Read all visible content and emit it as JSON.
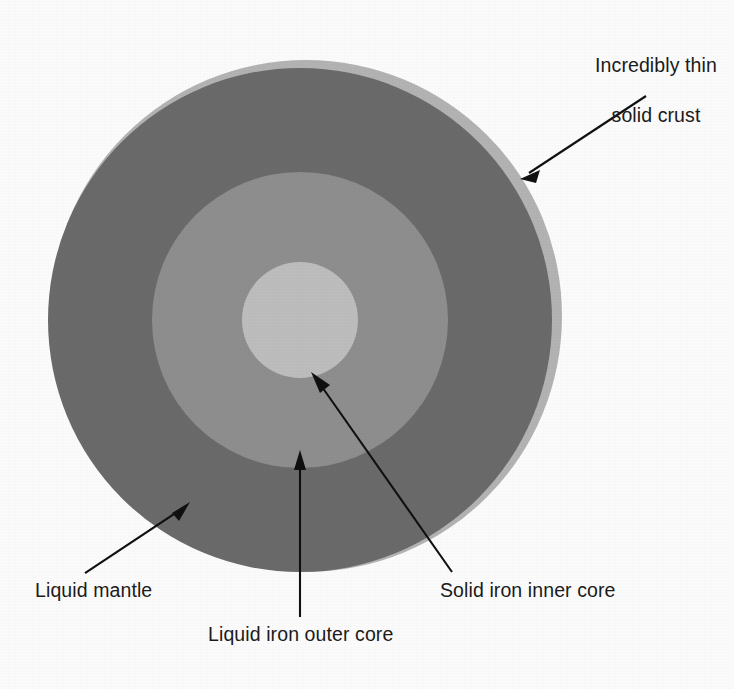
{
  "diagram": {
    "background_color": "#fdfdfd",
    "center": {
      "x": 300,
      "y": 320
    },
    "layers": [
      {
        "key": "crust",
        "label": "Incredibly thin\nsolid crust",
        "color": "#b3b3b3",
        "radius": 256,
        "offset_x": 6,
        "offset_y": -4,
        "description": "Incredibly thin solid crust"
      },
      {
        "key": "mantle",
        "label": "Liquid mantle",
        "color": "#6b6b6b",
        "radius": 252,
        "offset_x": 0,
        "offset_y": 0,
        "description": "Liquid mantle"
      },
      {
        "key": "outer_core",
        "label": "Liquid iron outer core",
        "color": "#8e8e8e",
        "radius": 148,
        "offset_x": 0,
        "offset_y": 0,
        "description": "Liquid iron outer core"
      },
      {
        "key": "inner_core",
        "label": "Solid iron inner core",
        "color": "#bdbdbd",
        "radius": 58,
        "offset_x": 0,
        "offset_y": 0,
        "description": "Solid iron inner core"
      }
    ],
    "labels": {
      "crust": {
        "line1": "Incredibly thin",
        "line2": "solid crust"
      },
      "mantle": "Liquid mantle",
      "outer_core": "Liquid iron outer core",
      "inner_core": "Solid iron inner core"
    },
    "leader_lines": [
      {
        "name": "crust-leader",
        "from_x": 646,
        "from_y": 96,
        "to_x": 523,
        "to_y": 177
      },
      {
        "name": "mantle-leader",
        "from_x": 85,
        "from_y": 573,
        "to_x": 188,
        "to_y": 503
      },
      {
        "name": "outer-core-leader",
        "from_x": 300,
        "from_y": 617,
        "to_x": 300,
        "to_y": 452
      },
      {
        "name": "inner-core-leader",
        "from_x": 452,
        "from_y": 572,
        "to_x": 311,
        "to_y": 374
      }
    ],
    "text_color": "#1b1b1b",
    "line_color": "#111111"
  }
}
